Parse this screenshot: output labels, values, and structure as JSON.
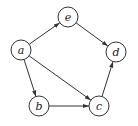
{
  "diagram": {
    "type": "directed-graph",
    "node_radius": 10,
    "colors": {
      "stroke": "#333333",
      "fill": "#ffffff",
      "text": "#222222"
    },
    "nodes": [
      {
        "id": "a",
        "label": "a",
        "x": 21,
        "y": 50
      },
      {
        "id": "e",
        "label": "e",
        "x": 68,
        "y": 17
      },
      {
        "id": "d",
        "label": "d",
        "x": 116,
        "y": 52
      },
      {
        "id": "b",
        "label": "b",
        "x": 39,
        "y": 106
      },
      {
        "id": "c",
        "label": "c",
        "x": 99,
        "y": 106
      }
    ],
    "edges": [
      {
        "from": "a",
        "to": "e"
      },
      {
        "from": "e",
        "to": "d"
      },
      {
        "from": "a",
        "to": "b"
      },
      {
        "from": "a",
        "to": "c"
      },
      {
        "from": "b",
        "to": "c"
      },
      {
        "from": "c",
        "to": "d"
      }
    ]
  }
}
